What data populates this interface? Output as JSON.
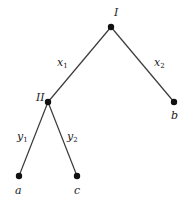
{
  "diagram": {
    "type": "game-tree",
    "nodes": [
      {
        "id": "I",
        "label": "I",
        "x": 111,
        "y": 27,
        "lx": 114,
        "ly": 16
      },
      {
        "id": "II",
        "label": "II",
        "x": 48,
        "y": 102,
        "lx": 37,
        "ly": 101
      },
      {
        "id": "b",
        "label": "b",
        "x": 174,
        "y": 102,
        "lx": 172,
        "ly": 119
      },
      {
        "id": "a",
        "label": "a",
        "x": 19,
        "y": 176,
        "lx": 15,
        "ly": 194
      },
      {
        "id": "c",
        "label": "c",
        "x": 77,
        "y": 176,
        "lx": 74,
        "ly": 194
      }
    ],
    "edges": [
      {
        "from": "I",
        "to": "II",
        "label": "x",
        "sub": "1",
        "lx": 58,
        "ly": 66
      },
      {
        "from": "I",
        "to": "b",
        "label": "x",
        "sub": "2",
        "lx": 155,
        "ly": 66
      },
      {
        "from": "II",
        "to": "a",
        "label": "y",
        "sub": "1",
        "lx": 18,
        "ly": 140
      },
      {
        "from": "II",
        "to": "c",
        "label": "y",
        "sub": "2",
        "lx": 68,
        "ly": 140
      }
    ]
  }
}
